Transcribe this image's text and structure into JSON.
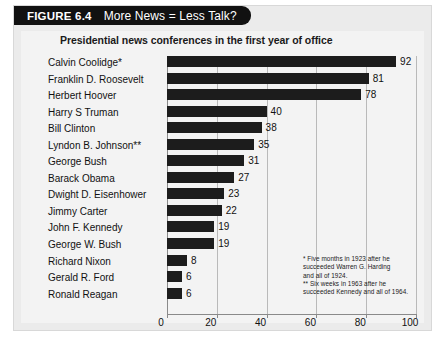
{
  "figure": {
    "number_label": "FIGURE 6.4",
    "title": "More News = Less Talk?"
  },
  "chart_data": {
    "type": "bar",
    "orientation": "horizontal",
    "title": "Presidential news conferences in the first year of office",
    "subtitle": "",
    "xlabel": "",
    "ylabel": "",
    "xlim": [
      0,
      100
    ],
    "xticks": [
      0,
      20,
      40,
      60,
      80,
      100
    ],
    "grid": true,
    "grid_axis": "x",
    "legend": false,
    "bar_color": "#1c1c1c",
    "categories": [
      "Calvin Coolidge*",
      "Franklin D. Roosevelt",
      "Herbert Hoover",
      "Harry S Truman",
      "Bill Clinton",
      "Lyndon B. Johnson**",
      "George Bush",
      "Barack Obama",
      "Dwight D. Eisenhower",
      "Jimmy Carter",
      "John F. Kennedy",
      "George W. Bush",
      "Richard Nixon",
      "Gerald R. Ford",
      "Ronald Reagan"
    ],
    "values": [
      92,
      81,
      78,
      40,
      38,
      35,
      31,
      27,
      23,
      22,
      19,
      19,
      8,
      6,
      6
    ],
    "annotations": [
      "* Five months in 1923 after he succeeded Warren G. Harding and all of 1924.",
      "** Six weeks in 1963 after he succeeded Kennedy and all of 1964."
    ]
  },
  "footnotes": {
    "line1": "* Five months in 1923 after he",
    "line2": "succeeded Warren G. Harding",
    "line3": "and all of 1924.",
    "line4": "** Six weeks in 1963 after he",
    "line5": "succeeded Kennedy and all of 1964."
  }
}
